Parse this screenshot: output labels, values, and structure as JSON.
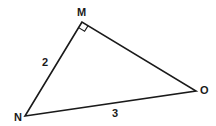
{
  "diagram": {
    "type": "right-triangle",
    "vertices": [
      {
        "label": "M",
        "x": 82,
        "y": 22,
        "label_x": 77,
        "label_y": 16
      },
      {
        "label": "N",
        "x": 25,
        "y": 116,
        "label_x": 14,
        "label_y": 121
      },
      {
        "label": "O",
        "x": 196,
        "y": 91,
        "label_x": 200,
        "label_y": 94
      }
    ],
    "sides": [
      {
        "from": "N",
        "to": "M",
        "length_label": "2",
        "label_x": 42,
        "label_y": 66
      },
      {
        "from": "N",
        "to": "O",
        "length_label": "3",
        "label_x": 112,
        "label_y": 117
      },
      {
        "from": "M",
        "to": "O",
        "length_label": ""
      }
    ],
    "right_angle_at": "M",
    "stroke_color": "#1a1a1a"
  }
}
